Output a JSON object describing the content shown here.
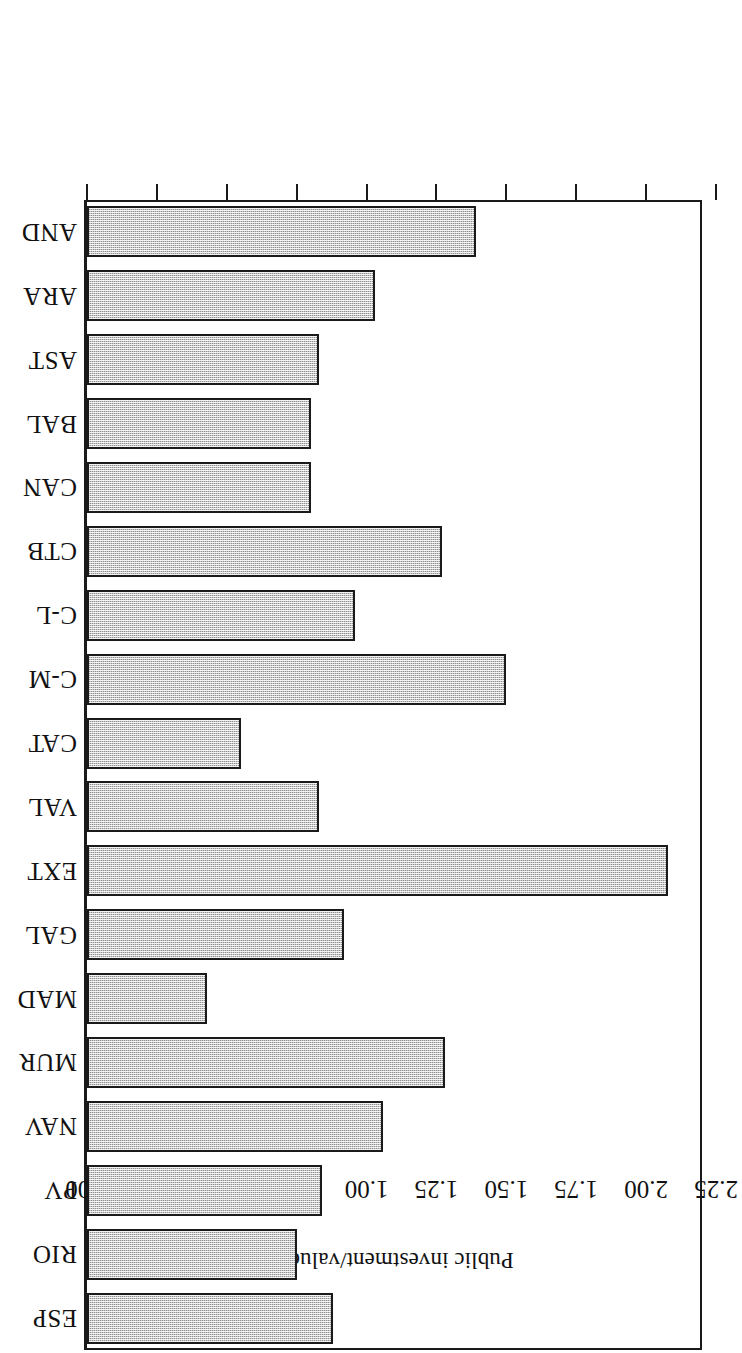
{
  "chart_data": {
    "type": "bar",
    "orientation": "horizontal",
    "title": "",
    "xlabel": "Public investment/value added",
    "ylabel": "",
    "categories": [
      "AND",
      "ARA",
      "AST",
      "BAL",
      "CAN",
      "CTB",
      "C-L",
      "C-M",
      "CAT",
      "VAL",
      "EXT",
      "GAL",
      "MAD",
      "MUR",
      "NAV",
      "PV",
      "RIO",
      "ESP"
    ],
    "values": [
      1.39,
      1.03,
      0.83,
      0.8,
      0.8,
      1.27,
      0.96,
      1.5,
      0.55,
      0.83,
      2.08,
      0.92,
      0.43,
      1.28,
      1.06,
      0.84,
      0.75,
      0.88
    ],
    "tick_labels": [
      "0.00",
      "0.25",
      "0.50",
      "0.75",
      "1.00",
      "1.25",
      "1.50",
      "1.75",
      "2.00",
      "2.25"
    ],
    "tick_values": [
      0.0,
      0.25,
      0.5,
      0.75,
      1.0,
      1.25,
      1.5,
      1.75,
      2.0,
      2.25
    ],
    "xlim": [
      0,
      2.25
    ],
    "grid": false,
    "legend": null,
    "bar_fill_color": "#c9c9c9",
    "bar_edge_color": "#1a1a1a",
    "background_color": "#ffffff",
    "rotated_180": true
  },
  "figure": {
    "axis_title": "Public investment/value added"
  }
}
